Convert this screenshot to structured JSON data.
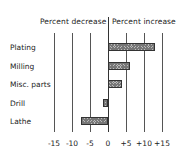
{
  "chart_data": {
    "type": "bar",
    "orientation": "horizontal",
    "title": "",
    "header_left": "Percent decrease",
    "header_right": "Percent increase",
    "categories": [
      "Plating",
      "Milling",
      "Misc. parts",
      "Drill",
      "Lathe"
    ],
    "values": [
      13,
      6,
      4,
      -1.5,
      -7.5
    ],
    "xlabel": "",
    "ylabel": "",
    "xlim": [
      -15,
      15
    ],
    "xticks": [
      -15,
      -10,
      -5,
      0,
      5,
      10,
      15
    ],
    "xtick_labels": [
      "-15",
      "-10",
      "-5",
      "0",
      "+5",
      "+10",
      "+15"
    ],
    "grid": true,
    "legend": "none"
  }
}
